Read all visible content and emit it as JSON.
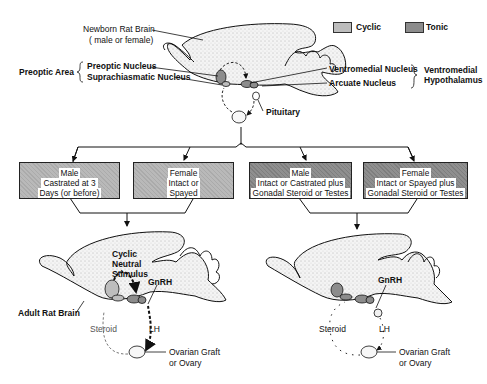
{
  "legend": {
    "items": [
      {
        "label": "Cyclic",
        "color": "#bdbdbd"
      },
      {
        "label": "Tonic",
        "color": "#8c8c8c"
      }
    ]
  },
  "top_brain": {
    "title_line1": "Newborn Rat Brain",
    "title_line2": "( male or female)",
    "preoptic_area": "Preoptic Area",
    "preoptic_nucleus": "Preoptic Nucleus",
    "suprachiasmatic_nucleus": "Suprachiasmatic Nucleus",
    "ventromedial_nucleus": "Ventromedial Nucleus",
    "arcuate_nucleus": "Arcuate Nucleus",
    "ventromedial_hypothalamus_line1": "Ventromedial",
    "ventromedial_hypothalamus_line2": "Hypothalamus",
    "pituitary": "Pituitary"
  },
  "conditions": [
    {
      "type": "cyclic",
      "lines": [
        "Male",
        "Castrated at 3",
        "Days  (or before)"
      ]
    },
    {
      "type": "cyclic",
      "lines": [
        "Female",
        "Intact  or",
        "Spayed"
      ]
    },
    {
      "type": "tonic",
      "lines": [
        "Male",
        "Intact or Castrated plus",
        "Gonadal Steroid or Testes"
      ]
    },
    {
      "type": "tonic",
      "lines": [
        "Female",
        "Intact or Spayed plus",
        "Gonadal Steroid  or Testes"
      ]
    }
  ],
  "left_brain": {
    "stimulus_line1": "Cyclic",
    "stimulus_line2": "Neutral",
    "stimulus_line3": "Stimulus",
    "gnrh": "GnRH",
    "adult_rat_brain": "Adult Rat Brain",
    "steroid": "Steroid",
    "lh": "LH",
    "ovary_line1": "Ovarian Graft",
    "ovary_line2": "or Ovary"
  },
  "right_brain": {
    "gnrh": "GnRH",
    "steroid": "Steroid",
    "lh": "LH",
    "ovary_line1": "Ovarian Graft",
    "ovary_line2": "or Ovary"
  }
}
